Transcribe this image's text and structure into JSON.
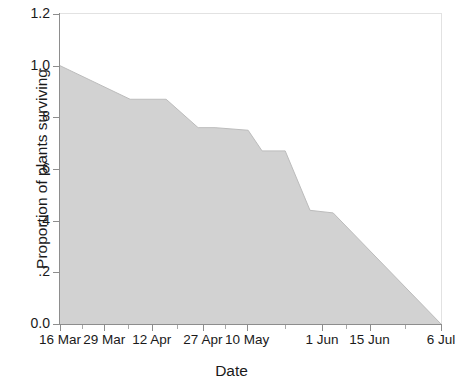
{
  "chart_data": {
    "type": "area",
    "title": "",
    "xlabel": "Date",
    "ylabel": "Proportion of plants surviving",
    "ylim": [
      0.0,
      1.2
    ],
    "grid": false,
    "legend": null,
    "fill_color": "#d2d2d2",
    "line_color": "#b9b9b9",
    "axis_color": "#8d8d8d",
    "y_ticks": [
      "0.0",
      ".2",
      ".4",
      ".6",
      ".8",
      "1.0",
      "1.2"
    ],
    "y_tick_values": [
      0.0,
      0.2,
      0.4,
      0.6,
      0.8,
      1.0,
      1.2
    ],
    "x_tick_labels": [
      "16 Mar",
      "29 Mar",
      "12 Apr",
      "27 Apr",
      "10 May",
      "1 Jun",
      "15 Jun",
      "6 Jul"
    ],
    "x_tick_positions": [
      0,
      13,
      27,
      42,
      55,
      77,
      91,
      112
    ],
    "x_axis_unit": "days from 16 Mar",
    "x_range_days": [
      0,
      112
    ],
    "series": [
      {
        "name": "Proportion of plants surviving",
        "x": [
          0,
          20.6,
          31.2,
          40.6,
          45.6,
          55.3,
          59.4,
          66.2,
          73.5,
          80.3,
          112
        ],
        "x_labels": [
          "16 Mar",
          "5 Apr",
          "16 Apr",
          "25 Apr",
          "30 Apr",
          "10 May",
          "14 May",
          "21 May",
          "28 May",
          "4 Jun",
          "6 Jul"
        ],
        "values": [
          1.0,
          0.87,
          0.87,
          0.76,
          0.76,
          0.75,
          0.67,
          0.67,
          0.44,
          0.43,
          0.0
        ]
      }
    ]
  },
  "axis": {
    "y_title": "Proportion of plants surviving",
    "x_title": "Date"
  }
}
